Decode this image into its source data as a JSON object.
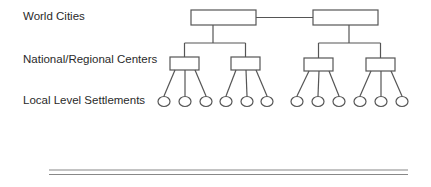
{
  "diagram": {
    "levels": [
      {
        "label": "World Cities"
      },
      {
        "label": "National/Regional Centers"
      },
      {
        "label": "Local Level Settlements"
      }
    ],
    "structure": {
      "world_cities": 2,
      "regional_centers_per_world_city": 2,
      "settlements_per_regional_center": 3
    },
    "colors": {
      "stroke": "#555555",
      "text": "#2a2a2a",
      "background": "#ffffff",
      "rule": "#888888"
    }
  }
}
